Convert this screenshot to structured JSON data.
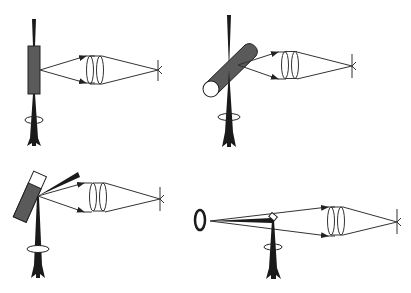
{
  "figure": {
    "type": "optical-schematic",
    "panel_count": 4,
    "colors": {
      "background": "#ffffff",
      "line": "#333333",
      "beam": "#1a1a1a",
      "sample_fill": "#5a5a5a",
      "open_fill": "#ffffff"
    },
    "panels": [
      {
        "id": "a",
        "position": "top-left",
        "sample": "flat-plate-sample",
        "geometry": "transmission"
      },
      {
        "id": "b",
        "position": "top-right",
        "sample": "cylindrical-sample",
        "geometry": "oblique-cylinder"
      },
      {
        "id": "c",
        "position": "bottom-left",
        "sample": "tilted-cuvette",
        "geometry": "reflection"
      },
      {
        "id": "d",
        "position": "bottom-right",
        "sample": "small-prism-with-ring-aperture",
        "geometry": "mirror-deflection"
      }
    ],
    "icons": [
      "laser-beam-arrow-icon",
      "rotation-ring-icon",
      "lens-doublet-icon",
      "focus-point-icon",
      "ray-arrow-icon"
    ]
  }
}
